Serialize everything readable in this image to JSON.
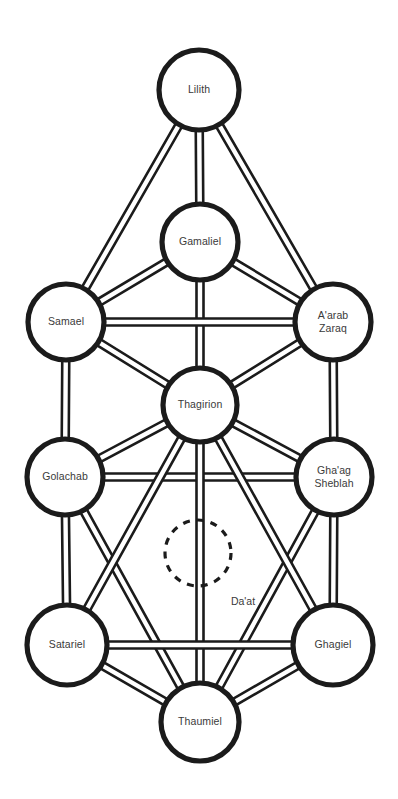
{
  "diagram": {
    "background_color": "#ffffff",
    "ink_color": "#1b1b1b",
    "label_color": "#3a3a3a",
    "nodes": [
      {
        "id": "lilith",
        "label": "Lilith",
        "lines": [
          "Lilith"
        ],
        "cx": 199,
        "cy": 90,
        "r": 40
      },
      {
        "id": "gamaliel",
        "label": "Gamaliel",
        "lines": [
          "Gamaliel"
        ],
        "cx": 200,
        "cy": 242,
        "r": 38
      },
      {
        "id": "samael",
        "label": "Samael",
        "lines": [
          "Samael"
        ],
        "cx": 66,
        "cy": 322,
        "r": 38
      },
      {
        "id": "aarab-zaraq",
        "label": "A'arab Zaraq",
        "lines": [
          "A'arab",
          "Zaraq"
        ],
        "cx": 333,
        "cy": 322,
        "r": 38
      },
      {
        "id": "thagirion",
        "label": "Thagirion",
        "lines": [
          "Thagirion"
        ],
        "cx": 200,
        "cy": 405,
        "r": 37
      },
      {
        "id": "golachab",
        "label": "Golachab",
        "lines": [
          "Golachab"
        ],
        "cx": 65,
        "cy": 477,
        "r": 38
      },
      {
        "id": "ghaag-sheblah",
        "label": "Gha'ag Sheblah",
        "lines": [
          "Gha'ag",
          "Sheblah"
        ],
        "cx": 334,
        "cy": 477,
        "r": 38
      },
      {
        "id": "satariel",
        "label": "Satariel",
        "lines": [
          "Satariel"
        ],
        "cx": 67,
        "cy": 645,
        "r": 40
      },
      {
        "id": "ghagiel",
        "label": "Ghagiel",
        "lines": [
          "Ghagiel"
        ],
        "cx": 333,
        "cy": 645,
        "r": 40
      },
      {
        "id": "thaumiel",
        "label": "Thaumiel",
        "lines": [
          "Thaumiel"
        ],
        "cx": 200,
        "cy": 722,
        "r": 39
      }
    ],
    "hidden_node": {
      "id": "daat",
      "label": "Da'at",
      "cx": 198,
      "cy": 553,
      "r": 33,
      "style": "dashed",
      "label_x": 243,
      "label_y": 602
    },
    "paths": [
      {
        "from": "lilith",
        "to": "samael",
        "width": 7
      },
      {
        "from": "lilith",
        "to": "gamaliel",
        "width": 7
      },
      {
        "from": "lilith",
        "to": "aarab-zaraq",
        "width": 7
      },
      {
        "from": "gamaliel",
        "to": "samael",
        "width": 7
      },
      {
        "from": "gamaliel",
        "to": "aarab-zaraq",
        "width": 7
      },
      {
        "from": "gamaliel",
        "to": "thagirion",
        "width": 7
      },
      {
        "from": "samael",
        "to": "aarab-zaraq",
        "width": 7
      },
      {
        "from": "samael",
        "to": "thagirion",
        "width": 7
      },
      {
        "from": "samael",
        "to": "golachab",
        "width": 7
      },
      {
        "from": "aarab-zaraq",
        "to": "thagirion",
        "width": 7
      },
      {
        "from": "aarab-zaraq",
        "to": "ghaag-sheblah",
        "width": 7
      },
      {
        "from": "golachab",
        "to": "thagirion",
        "width": 7
      },
      {
        "from": "golachab",
        "to": "ghaag-sheblah",
        "width": 7
      },
      {
        "from": "golachab",
        "to": "satariel",
        "width": 7
      },
      {
        "from": "golachab",
        "to": "thaumiel",
        "width": 7
      },
      {
        "from": "ghaag-sheblah",
        "to": "thagirion",
        "width": 7
      },
      {
        "from": "ghaag-sheblah",
        "to": "ghagiel",
        "width": 7
      },
      {
        "from": "ghaag-sheblah",
        "to": "thaumiel",
        "width": 7
      },
      {
        "from": "thagirion",
        "to": "satariel",
        "width": 7
      },
      {
        "from": "thagirion",
        "to": "ghagiel",
        "width": 7
      },
      {
        "from": "thagirion",
        "to": "thaumiel",
        "width": 7
      },
      {
        "from": "satariel",
        "to": "ghagiel",
        "width": 7
      },
      {
        "from": "satariel",
        "to": "thaumiel",
        "width": 7
      },
      {
        "from": "ghagiel",
        "to": "thaumiel",
        "width": 7
      }
    ]
  }
}
